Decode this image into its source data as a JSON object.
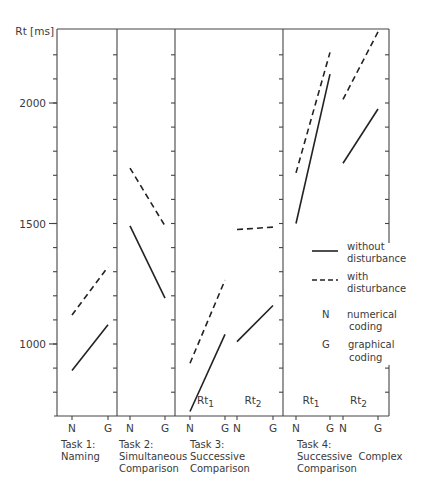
{
  "chart_data": {
    "type": "line",
    "title": "",
    "ylabel": "Rt [ms]",
    "xlabel": "",
    "ylim": [
      700,
      2300
    ],
    "y_ticks_labeled": [
      1000,
      1500,
      2000
    ],
    "y_tick_step": 100,
    "grid": false,
    "x_codes": [
      "N",
      "G"
    ],
    "legend": {
      "position": "inside right, Task 4 panel",
      "entries": [
        {
          "style": "solid",
          "label": "without disturbance"
        },
        {
          "style": "dashed",
          "label": "with disturbance"
        },
        {
          "symbol": "N",
          "label": "numerical coding"
        },
        {
          "symbol": "G",
          "label": "graphical coding"
        }
      ]
    },
    "panels": [
      {
        "task": "Task 1:",
        "name_lines": [
          "Naming"
        ],
        "subgroups": [
          {
            "label": "",
            "series": [
              {
                "name": "without disturbance",
                "style": "solid",
                "N": 890,
                "G": 1080
              },
              {
                "name": "with disturbance",
                "style": "dashed",
                "N": 1120,
                "G": 1320
              }
            ]
          }
        ]
      },
      {
        "task": "Task 2:",
        "name_lines": [
          "Simultaneous",
          "Comparison"
        ],
        "subgroups": [
          {
            "label": "",
            "series": [
              {
                "name": "without disturbance",
                "style": "solid",
                "N": 1490,
                "G": 1190
              },
              {
                "name": "with disturbance",
                "style": "dashed",
                "N": 1730,
                "G": 1490
              }
            ]
          }
        ]
      },
      {
        "task": "Task 3:",
        "name_lines": [
          "Successive",
          "Comparison"
        ],
        "subgroups": [
          {
            "label": "Rt1",
            "series": [
              {
                "name": "without disturbance",
                "style": "solid",
                "N": 720,
                "G": 1040
              },
              {
                "name": "with disturbance",
                "style": "dashed",
                "N": 920,
                "G": 1265
              }
            ]
          },
          {
            "label": "Rt2",
            "series": [
              {
                "name": "without disturbance",
                "style": "solid",
                "N": 1010,
                "G": 1160
              },
              {
                "name": "with disturbance",
                "style": "dashed",
                "N": 1475,
                "G": 1485
              }
            ]
          }
        ]
      },
      {
        "task": "Task 4:",
        "name_lines": [
          "Successive  Complex",
          "Comparison"
        ],
        "subgroups": [
          {
            "label": "Rt1",
            "series": [
              {
                "name": "without disturbance",
                "style": "solid",
                "N": 1500,
                "G": 2120
              },
              {
                "name": "with disturbance",
                "style": "dashed",
                "N": 1710,
                "G": 2210
              }
            ]
          },
          {
            "label": "Rt2",
            "series": [
              {
                "name": "without disturbance",
                "style": "solid",
                "N": 1750,
                "G": 1975
              },
              {
                "name": "with disturbance",
                "style": "dashed",
                "N": 2015,
                "G": 2295
              }
            ]
          }
        ]
      }
    ]
  },
  "labels": {
    "y_axis_title": "Rt [ms]",
    "legend_solid_1": "without",
    "legend_solid_2": "disturbance",
    "legend_dashed_1": "with",
    "legend_dashed_2": "disturbance",
    "legend_n_symbol": "N",
    "legend_n_1": "numerical",
    "legend_n_2": "coding",
    "legend_g_symbol": "G",
    "legend_g_1": "graphical",
    "legend_g_2": "coding"
  }
}
